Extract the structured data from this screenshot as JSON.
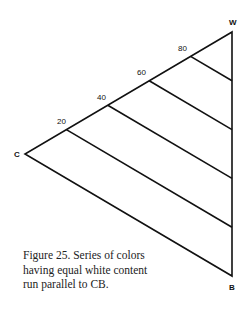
{
  "figure": {
    "vertices": [
      {
        "id": "W",
        "label": "W",
        "x": 232,
        "y": 32,
        "label_x": 229,
        "label_y": 25
      },
      {
        "id": "C",
        "label": "C",
        "x": 25,
        "y": 154,
        "label_x": 14,
        "label_y": 157
      },
      {
        "id": "B",
        "label": "B",
        "x": 232,
        "y": 276,
        "label_x": 229,
        "label_y": 290
      }
    ],
    "ticks": [
      {
        "label": "20",
        "x": 66.4,
        "y": 129.6,
        "end_x": 232,
        "end_y": 227.2,
        "label_x": 57,
        "label_y": 124
      },
      {
        "label": "40",
        "x": 107.8,
        "y": 105.2,
        "end_x": 232,
        "end_y": 178.4,
        "label_x": 97,
        "label_y": 100
      },
      {
        "label": "60",
        "x": 149.2,
        "y": 80.8,
        "end_x": 232,
        "end_y": 129.6,
        "label_x": 137,
        "label_y": 75
      },
      {
        "label": "80",
        "x": 190.6,
        "y": 56.4,
        "end_x": 232,
        "end_y": 80.8,
        "label_x": 178,
        "label_y": 51
      }
    ],
    "stroke_color": "#111111",
    "caption": {
      "lines": [
        "Figure 25. Series of colors",
        "having equal white content",
        "run parallel to CB."
      ]
    }
  }
}
